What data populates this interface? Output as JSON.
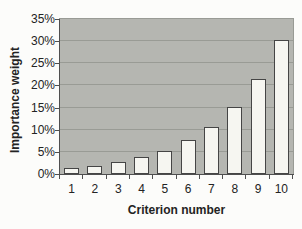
{
  "chart_data": {
    "type": "bar",
    "title": "",
    "xlabel": "Criterion number",
    "ylabel": "Importance weight",
    "categories": [
      "1",
      "2",
      "3",
      "4",
      "5",
      "6",
      "7",
      "8",
      "9",
      "10"
    ],
    "values": [
      1.3,
      1.9,
      2.7,
      3.8,
      5.3,
      7.6,
      10.7,
      15.1,
      21.4,
      30.2
    ],
    "ylim": [
      0,
      35
    ],
    "ytick_step": 5,
    "ytick_labels": [
      "0%",
      "5%",
      "10%",
      "15%",
      "20%",
      "25%",
      "30%",
      "35%"
    ],
    "grid": true,
    "legend": "none"
  },
  "colors": {
    "page_bg": "#fcfcfa",
    "plot_bg": "#b5b6b1",
    "gridline": "#999b95",
    "bar_fill": "#f6f6f1",
    "bar_border": "#454545",
    "axis": "#4f4f4f",
    "text": "#232323"
  }
}
